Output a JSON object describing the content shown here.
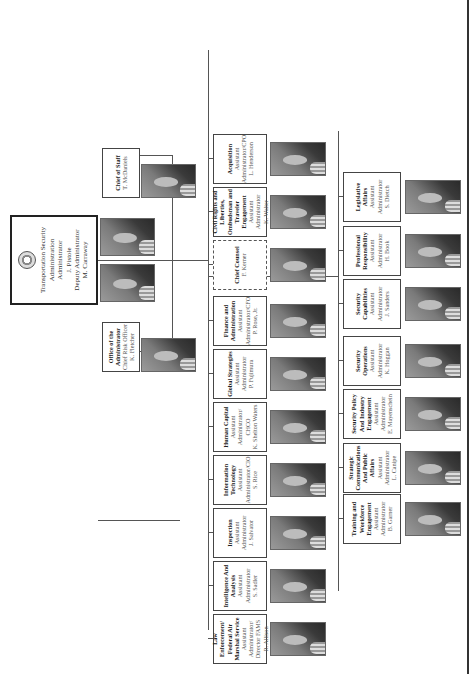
{
  "chart_title": "Transportation Security Administration Organizational Chart",
  "administrator": {
    "org": "Transportation Security Administration",
    "title": "Administrator",
    "name": "J. Pistole",
    "deputy_title": "Deputy Administrator",
    "deputy_name": "M. Carraway",
    "icon": "dhs-seal-icon"
  },
  "staff_offices": [
    {
      "title": "Chief of Staff",
      "name": "T. McDaniels"
    },
    {
      "title": "Office of the Administrator",
      "role": "Chief Risk Officer",
      "name": "K. Fletcher"
    }
  ],
  "row1": [
    {
      "title": "Law Enforcement/ Federal Air Marshal Service",
      "role": "Assistant Administrator/ Director FAMS",
      "name": "R. Allison"
    },
    {
      "title": "Intelligence And Analysis",
      "role": "Assistant Administrator",
      "name": "S. Sadler"
    },
    {
      "title": "Inspection",
      "role": "Assistant Administrator",
      "name": "J. Salvator"
    },
    {
      "title": "Information Technology",
      "role": "Assistant Administrator/CIO",
      "name": "S. Rice"
    },
    {
      "title": "Human Capital",
      "role": "Assistant Administrator/ CHCO",
      "name": "K. Shelton Waters"
    },
    {
      "title": "Global Strategies",
      "role": "Assistant Administrator",
      "name": "P. Fujimura"
    },
    {
      "title": "Finance and Administration",
      "role": "Assistant Administrator/CFO",
      "name": "P. Rose, Jr."
    },
    {
      "title": "Chief Counsel",
      "role": "",
      "name": "F. Kerner",
      "dashed": true
    },
    {
      "title": "Civil Rights and Liberties, Ombudsman and Traveler Engagement",
      "role": "Assistant Administrator",
      "name": "K. Walter"
    },
    {
      "title": "Acquisition",
      "role": "Assistant Administrator/CPO",
      "name": "L. Henderson"
    }
  ],
  "row2": [
    {
      "title": "Training and Workforce Engagement",
      "role": "Assistant Administrator",
      "name": "B. Garner"
    },
    {
      "title": "Strategic Communications And Public Affairs",
      "role": "Assistant Administrator",
      "name": "L. Canipe"
    },
    {
      "title": "Security Policy And Industry Engagement",
      "role": "Assistant Administrator",
      "name": "E. Mayenschein"
    },
    {
      "title": "Security Operations",
      "role": "Assistant Administrator",
      "name": "K. Hoggan"
    },
    {
      "title": "Security Capabilities",
      "role": "Assistant Administrator",
      "name": "J. Sanders"
    },
    {
      "title": "Professional Responsibility",
      "role": "Assistant Administrator",
      "name": "H. Book"
    },
    {
      "title": "Legislative Affairs",
      "role": "Assistant Administrator",
      "name": "S. Dietch"
    }
  ]
}
